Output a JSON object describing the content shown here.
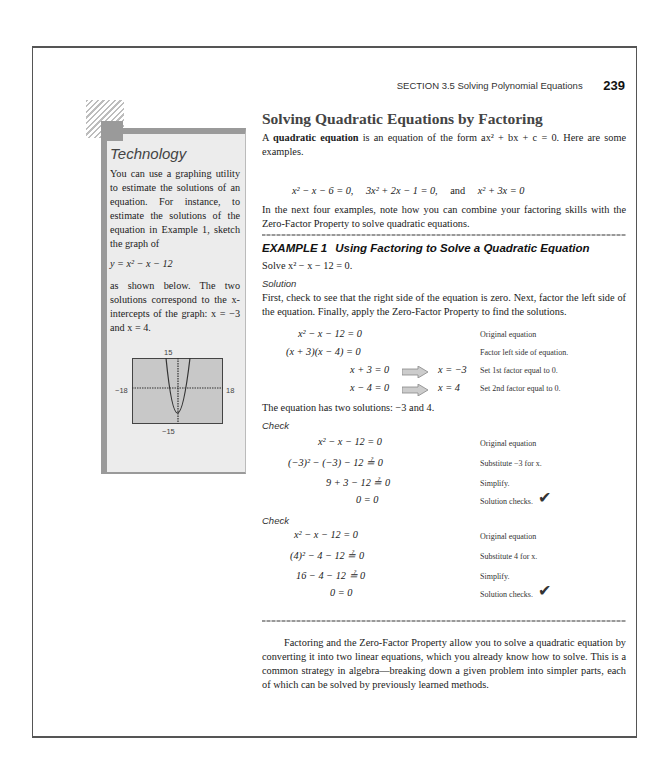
{
  "header": {
    "section": "SECTION 3.5   Solving Polynomial Equations",
    "page_number": "239"
  },
  "sidebar": {
    "title": "Technology",
    "para1": "You can use a graphing utility to estimate the solutions of an equation. For instance, to estimate the solutions of the equation in Example 1, sketch the graph of",
    "equation": "y = x² − x − 12",
    "para2": "as shown below. The two solutions correspond to the x-intercepts of the graph: x = −3 and x = 4.",
    "graph": {
      "ymax": "15",
      "ymin": "−15",
      "xmin": "−18",
      "xmax": "18"
    }
  },
  "main": {
    "title": "Solving Quadratic Equations by Factoring",
    "intro_bold": "quadratic equation",
    "intro_pre": "A ",
    "intro_post": " is an equation of the form ax² + bx + c = 0. Here are some examples.",
    "examples": [
      "x² − x − 6 = 0,",
      "3x² + 2x − 1 = 0,",
      "and",
      "x² + 3x = 0"
    ],
    "transition": "In the next four examples, note how you can combine your factoring skills with the Zero-Factor Property to solve quadratic equations.",
    "example": {
      "label": "EXAMPLE 1",
      "title": "Using Factoring to Solve a Quadratic Equation",
      "prompt": "Solve x² − x − 12 = 0.",
      "solution_label": "Solution",
      "solution_text": "First, check to see that the right side of the equation is zero. Next, factor the left side of the equation. Finally, apply the Zero-Factor Property to find the solutions.",
      "steps": [
        {
          "eq": "x² − x − 12 = 0",
          "result": "",
          "note": "Original equation"
        },
        {
          "eq": "(x + 3)(x − 4) = 0",
          "result": "",
          "note": "Factor left side of equation."
        },
        {
          "eq": "x + 3 = 0",
          "result": "x = −3",
          "note": "Set 1st factor equal to 0."
        },
        {
          "eq": "x − 4 = 0",
          "result": "x = 4",
          "note": "Set 2nd factor equal to 0."
        }
      ],
      "conclusion": "The equation has two solutions: −3 and 4.",
      "check_label": "Check",
      "check1": [
        {
          "eq": "x² − x − 12 = 0",
          "note": "Original equation"
        },
        {
          "eq": "(−3)² − (−3) − 12 ≟ 0",
          "note": "Substitute −3 for x."
        },
        {
          "eq": "9 + 3 − 12 ≟ 0",
          "note": "Simplify."
        },
        {
          "eq": "0 = 0",
          "note": "Solution checks."
        }
      ],
      "check2": [
        {
          "eq": "x² − x − 12 = 0",
          "note": "Original equation"
        },
        {
          "eq": "(4)² − 4 − 12 ≟ 0",
          "note": "Substitute 4 for x."
        },
        {
          "eq": "16 − 4 − 12 ≟ 0",
          "note": "Simplify."
        },
        {
          "eq": "0 = 0",
          "note": "Solution checks."
        }
      ]
    },
    "closing": "Factoring and the Zero-Factor Property allow you to solve a quadratic equation by converting it into two linear equations, which you already know how to solve. This is a common strategy in algebra—breaking down a given problem into simpler parts, each of which can be solved by previously learned methods."
  }
}
